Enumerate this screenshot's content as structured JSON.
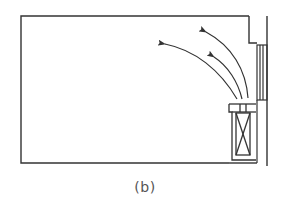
{
  "diagram": {
    "caption": "(b)",
    "line_color": "#333333",
    "background": "#ffffff",
    "elements": {
      "room": "room-outline",
      "window": "window-frame",
      "unit": "air-conditioning-unit",
      "airflow": [
        "airflow-arrow-1",
        "airflow-arrow-2",
        "airflow-arrow-3"
      ]
    }
  }
}
